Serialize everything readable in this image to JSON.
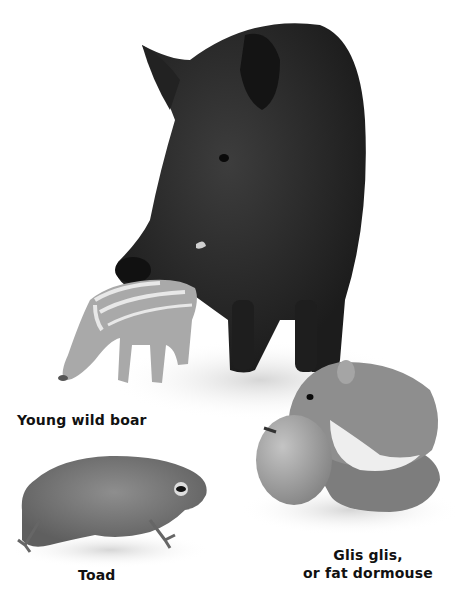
{
  "illustration": {
    "style": "grayscale naturalistic illustration",
    "colors": {
      "background": "#ffffff",
      "boar": "#2a2a2a",
      "piglet": "#a9a9a9",
      "dormouse": "#8c8c8c",
      "fruit": "#9d9d9d",
      "toad": "#7a7a7a",
      "caption": "#111111"
    }
  },
  "animals": [
    {
      "id": "wild-boar",
      "caption": ""
    },
    {
      "id": "young-wild-boar",
      "caption": "Young wild boar"
    },
    {
      "id": "toad",
      "caption": "Toad"
    },
    {
      "id": "dormouse",
      "caption_line1": "Glis glis,",
      "caption_line2": "or fat dormouse"
    }
  ]
}
